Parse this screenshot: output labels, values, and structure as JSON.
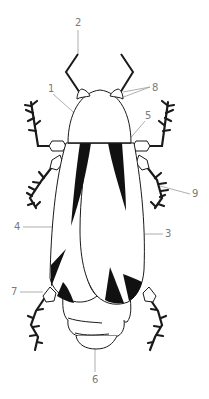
{
  "diagram": {
    "style": {
      "stroke": "#1a1a1a",
      "fill": "#ffffff",
      "marking": "#111111",
      "leader_line": "#9a9a9a",
      "label_color": "#7a7a7a"
    },
    "labels": [
      {
        "id": "1",
        "text": "1",
        "part": "pronotum"
      },
      {
        "id": "2",
        "text": "2",
        "part": "antenna"
      },
      {
        "id": "3",
        "text": "3",
        "part": "right-elytron"
      },
      {
        "id": "4",
        "text": "4",
        "part": "left-elytron"
      },
      {
        "id": "5",
        "text": "5",
        "part": "scutellum"
      },
      {
        "id": "6",
        "text": "6",
        "part": "abdomen"
      },
      {
        "id": "7",
        "text": "7",
        "part": "hind-leg-joint"
      },
      {
        "id": "8",
        "text": "8",
        "part": "eyes"
      },
      {
        "id": "9",
        "text": "9",
        "part": "middle-leg"
      }
    ]
  }
}
